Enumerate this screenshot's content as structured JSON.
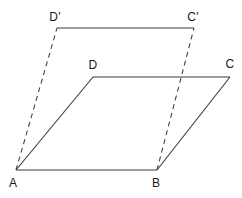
{
  "figure": {
    "width": 242,
    "height": 198,
    "background_color": "#ffffff",
    "stroke_color": "#3a3a3a",
    "dash_color": "#444444",
    "label_color": "#1a1a1a",
    "stroke_width": 1.1
  },
  "points": {
    "A": {
      "label": "A",
      "x": 16,
      "y": 170,
      "label_x": 13,
      "label_y": 183
    },
    "B": {
      "label": "B",
      "x": 157,
      "y": 170,
      "label_x": 156,
      "label_y": 183
    },
    "C": {
      "label": "C",
      "x": 230,
      "y": 77,
      "label_x": 230,
      "label_y": 64
    },
    "D": {
      "label": "D",
      "x": 93,
      "y": 77,
      "label_x": 93,
      "label_y": 65
    },
    "Cp": {
      "label": "C'",
      "x": 194,
      "y": 28,
      "label_x": 193,
      "label_y": 17
    },
    "Dp": {
      "label": "D'",
      "x": 57,
      "y": 28,
      "label_x": 55,
      "label_y": 17
    }
  },
  "segments": {
    "solid": [
      {
        "name": "segment-AB",
        "from": "A",
        "to": "B"
      },
      {
        "name": "segment-BC",
        "from": "B",
        "to": "C"
      },
      {
        "name": "segment-CD",
        "from": "C",
        "to": "D"
      },
      {
        "name": "segment-DA",
        "from": "D",
        "to": "A"
      },
      {
        "name": "segment-DpCp",
        "from": "Dp",
        "to": "Cp"
      }
    ],
    "dashed": [
      {
        "name": "segment-A-Dprime",
        "from": "A",
        "to": "Dp"
      },
      {
        "name": "segment-B-Cprime",
        "from": "B",
        "to": "Cp"
      }
    ],
    "dash_pattern": "5,4"
  }
}
